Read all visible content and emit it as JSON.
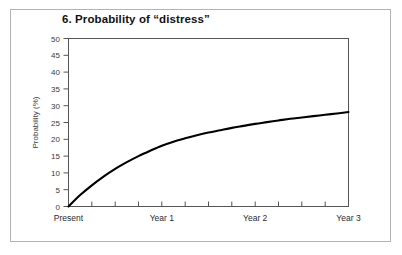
{
  "figure": {
    "title": "6. Probability of “distress”",
    "background_color": "#ffffff",
    "frame_color": "#b3b3b3",
    "line_color": "#000000",
    "axis_color": "#555555"
  },
  "chart_data": {
    "type": "line",
    "title": "6. Probability of “distress”",
    "xlabel": "",
    "ylabel": "Probability (%)",
    "ylim": [
      0,
      50
    ],
    "yticks": [
      0,
      5,
      10,
      15,
      20,
      25,
      30,
      35,
      40,
      45,
      50
    ],
    "ytick_labels": [
      "0",
      "5",
      "10",
      "15",
      "20",
      "25",
      "30",
      "35",
      "40",
      "45",
      "50"
    ],
    "xlim": [
      0,
      3
    ],
    "xtick_labels": [
      "Present",
      "Year 1",
      "Year 2",
      "Year 3"
    ],
    "xtick_positions": [
      0,
      1,
      2,
      3
    ],
    "x_minor_ticks": [
      0.25,
      0.5,
      0.75,
      1.25,
      1.5,
      1.75,
      2.25,
      2.5,
      2.75
    ],
    "grid": false,
    "legend": null,
    "series": [
      {
        "name": "Probability of distress",
        "x": [
          0,
          0.125,
          0.25,
          0.375,
          0.5,
          0.625,
          0.75,
          0.875,
          1.0,
          1.125,
          1.25,
          1.375,
          1.5,
          1.625,
          1.75,
          1.875,
          2.0,
          2.125,
          2.25,
          2.375,
          2.5,
          2.625,
          2.75,
          2.875,
          3.0
        ],
        "values": [
          0.0,
          3.4,
          6.3,
          8.9,
          11.2,
          13.2,
          15.0,
          16.6,
          18.1,
          19.3,
          20.3,
          21.2,
          22.0,
          22.7,
          23.4,
          24.0,
          24.6,
          25.1,
          25.6,
          26.1,
          26.5,
          26.9,
          27.3,
          27.7,
          28.1
        ]
      }
    ]
  },
  "axes": {
    "y_title": "Probability (%)",
    "y_labels": [
      "50",
      "45",
      "40",
      "35",
      "30",
      "25",
      "20",
      "15",
      "10",
      "5",
      "0"
    ],
    "x_labels": [
      "Present",
      "Year 1",
      "Year 2",
      "Year 3"
    ]
  }
}
